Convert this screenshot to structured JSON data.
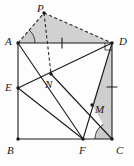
{
  "figure": {
    "kind": "geometry-diagram",
    "background_color": "#fdfdfd",
    "stroke_color": "#1a1a1a",
    "shade_color": "#c9c9c9",
    "dash_color": "#2a2a2a",
    "width": 134,
    "height": 166,
    "points": [
      {
        "name": "A",
        "label": "A",
        "x": 18,
        "y": 43,
        "label_x": 5,
        "label_y": 36,
        "dot": true
      },
      {
        "name": "B",
        "label": "B",
        "x": 18,
        "y": 139,
        "label_x": 7,
        "label_y": 145,
        "dot": true
      },
      {
        "name": "C",
        "label": "C",
        "x": 112,
        "y": 139,
        "label_x": 116,
        "label_y": 145,
        "dot": true
      },
      {
        "name": "D",
        "label": "D",
        "x": 112,
        "y": 43,
        "label_x": 119,
        "label_y": 36,
        "dot": true
      },
      {
        "name": "E",
        "label": "E",
        "x": 18,
        "y": 88,
        "label_x": 5,
        "label_y": 82,
        "dot": true
      },
      {
        "name": "F",
        "label": "F",
        "x": 83,
        "y": 139,
        "label_x": 79,
        "label_y": 145,
        "dot": true
      },
      {
        "name": "M",
        "label": "M",
        "x": 92,
        "y": 105,
        "label_x": 95,
        "label_y": 104,
        "dot": true
      },
      {
        "name": "N",
        "label": "N",
        "x": 51,
        "y": 74,
        "label_x": 45,
        "label_y": 79,
        "dot": true
      },
      {
        "name": "P",
        "label": "P",
        "x": 44,
        "y": 13,
        "label_x": 37,
        "label_y": 3,
        "dot": true
      }
    ],
    "solid_segments": [
      {
        "name": "side-AB",
        "from": "A",
        "to": "B"
      },
      {
        "name": "side-BC",
        "from": "B",
        "to": "C"
      },
      {
        "name": "side-CD",
        "from": "C",
        "to": "D"
      },
      {
        "name": "side-AD",
        "from": "A",
        "to": "D"
      },
      {
        "name": "segment-A-F",
        "from": "A",
        "to": "F"
      },
      {
        "name": "segment-D-E",
        "from": "D",
        "to": "E"
      },
      {
        "name": "segment-E-F",
        "from": "E",
        "to": "F"
      },
      {
        "name": "segment-D-F",
        "from": "D",
        "to": "F"
      },
      {
        "name": "segment-N-C",
        "from": "N",
        "to": "C"
      }
    ],
    "dashed_segments": [
      {
        "name": "segment-A-P",
        "from": "A",
        "to": "P"
      },
      {
        "name": "segment-P-D",
        "from": "P",
        "to": "D"
      },
      {
        "name": "segment-P-N",
        "from": "P",
        "to": "N"
      }
    ],
    "shaded_regions": [
      {
        "name": "region-triangle-APD",
        "polygon": "A,P,D"
      }
    ],
    "shaded_angle_marks": [
      {
        "name": "angle-mark-at-A",
        "vertex": "A",
        "ray1": "P",
        "ray2": "D",
        "radius": 17
      },
      {
        "name": "angle-mark-at-C",
        "vertex": "C",
        "ray1": "M",
        "ray2": "F",
        "radius": 17
      }
    ],
    "shaded_triangles": [
      {
        "name": "region-triangle-DMC",
        "polygon": "D,M,C"
      }
    ],
    "tick_marks": [
      {
        "name": "tick-on-AD",
        "x": 62,
        "y": 43,
        "angle": 90
      },
      {
        "name": "tick-on-DC",
        "x": 112,
        "y": 87,
        "angle": 0
      }
    ],
    "right_angle_marks": [
      {
        "name": "right-angle-at-D",
        "vertex": "D",
        "size": 7
      }
    ]
  }
}
